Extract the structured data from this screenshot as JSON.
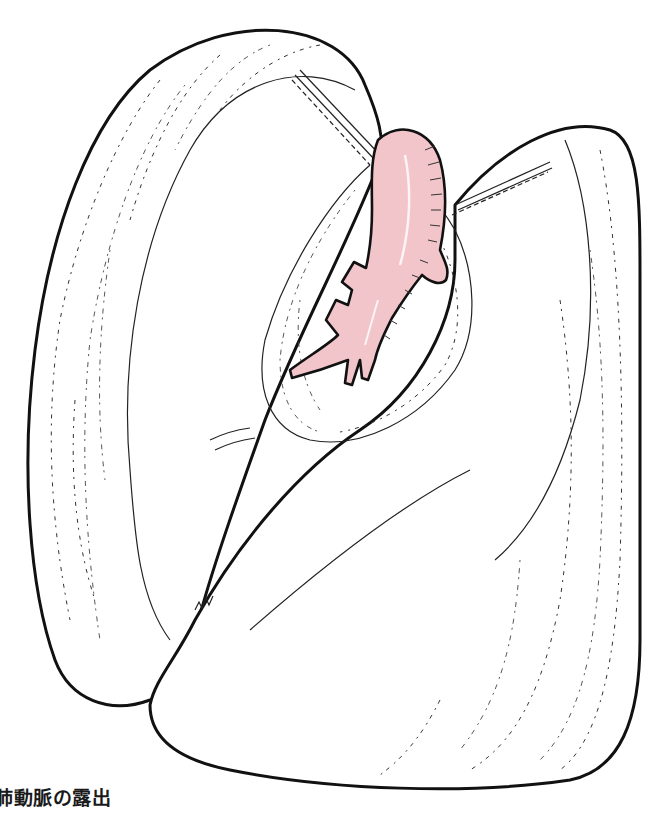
{
  "figure": {
    "caption": "肺動脈の露出",
    "colors": {
      "artery_fill": "#f2c5ca",
      "outline": "#111111",
      "background": "#ffffff"
    }
  }
}
